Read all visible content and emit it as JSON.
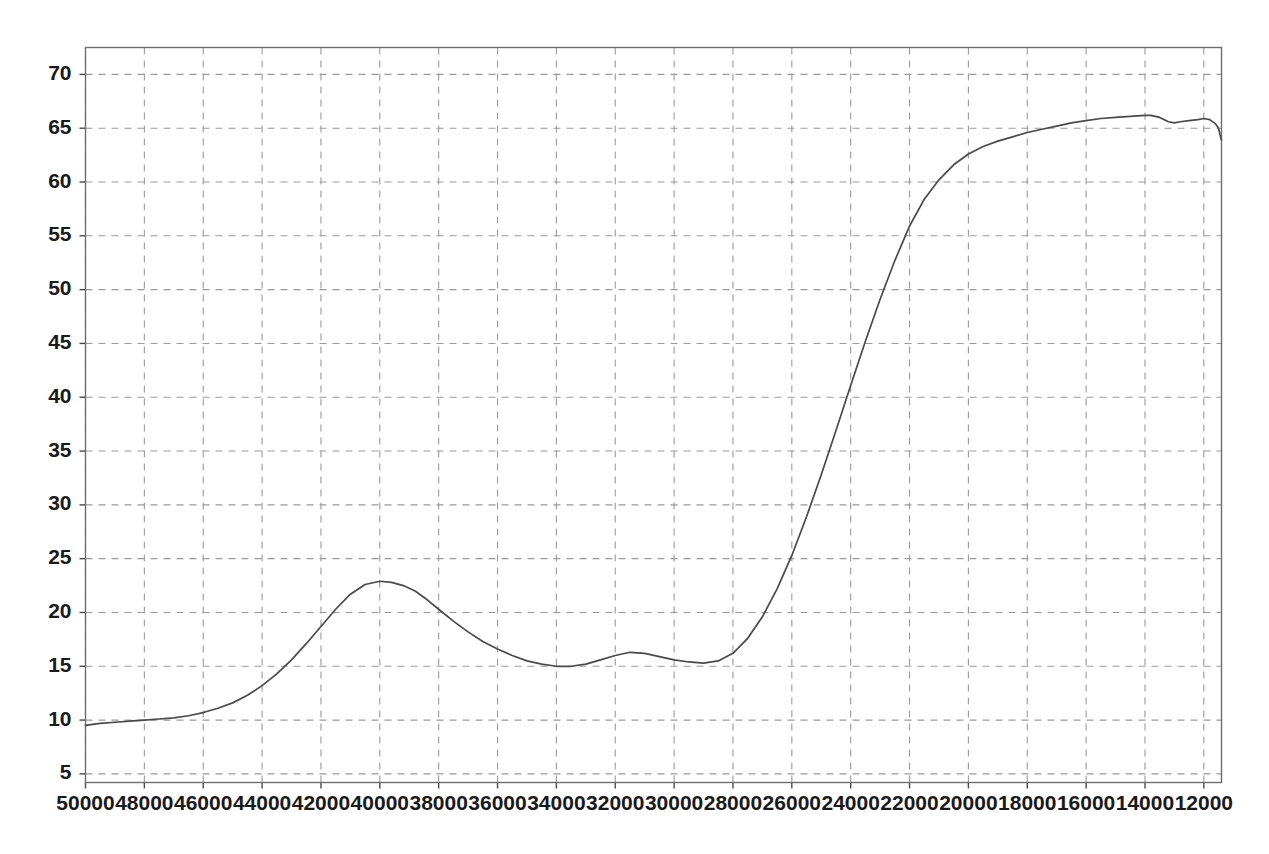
{
  "chart_data": {
    "type": "line",
    "title": "",
    "subtitle": "",
    "xlabel": "",
    "ylabel": "",
    "xlim": [
      50000,
      11400
    ],
    "ylim": [
      4.2,
      72.5
    ],
    "x_axis_reversed": true,
    "grid": true,
    "legend": "none",
    "line_color": "#4a4a4a",
    "grid_color": "#9a9a9a",
    "frame_color": "#6f6f6f",
    "background_color": "#ffffff",
    "xticks": [
      50000,
      48000,
      46000,
      44000,
      42000,
      40000,
      38000,
      36000,
      34000,
      32000,
      30000,
      28000,
      26000,
      24000,
      22000,
      20000,
      18000,
      16000,
      14000,
      12000
    ],
    "xtick_labels": [
      "50000",
      "48000",
      "46000",
      "44000",
      "42000",
      "40000",
      "38000",
      "36000",
      "34000",
      "32000",
      "30000",
      "28000",
      "26000",
      "24000",
      "22000",
      "20000",
      "18000",
      "16000",
      "14000",
      "12000"
    ],
    "yticks": [
      5,
      10,
      15,
      20,
      25,
      30,
      35,
      40,
      45,
      50,
      55,
      60,
      65,
      70
    ],
    "ytick_labels": [
      "5",
      "10",
      "15",
      "20",
      "25",
      "30",
      "35",
      "40",
      "45",
      "50",
      "55",
      "60",
      "65",
      "70"
    ],
    "series": [
      {
        "name": "spectrum",
        "x": [
          50000,
          49500,
          49000,
          48500,
          48000,
          47500,
          47000,
          46500,
          46000,
          45500,
          45000,
          44500,
          44000,
          43500,
          43000,
          42500,
          42000,
          41500,
          41000,
          40500,
          40000,
          39600,
          39200,
          38800,
          38400,
          38000,
          37500,
          37000,
          36500,
          36000,
          35500,
          35000,
          34500,
          34000,
          33500,
          33000,
          32500,
          32000,
          31500,
          31000,
          30500,
          30000,
          29500,
          29000,
          28500,
          28000,
          27500,
          27000,
          26500,
          26000,
          25500,
          25000,
          24500,
          24000,
          23500,
          23000,
          22500,
          22000,
          21500,
          21000,
          20500,
          20000,
          19500,
          19000,
          18500,
          18000,
          17500,
          17000,
          16500,
          16000,
          15500,
          15000,
          14500,
          14000,
          13800,
          13500,
          13200,
          13000,
          12800,
          12500,
          12200,
          12000,
          11800,
          11600,
          11500,
          11450,
          11400
        ],
        "y": [
          9.5,
          9.7,
          9.8,
          9.9,
          10.0,
          10.1,
          10.2,
          10.4,
          10.7,
          11.1,
          11.6,
          12.3,
          13.2,
          14.3,
          15.6,
          17.1,
          18.7,
          20.3,
          21.7,
          22.6,
          22.9,
          22.8,
          22.5,
          22.0,
          21.2,
          20.3,
          19.2,
          18.2,
          17.3,
          16.6,
          16.0,
          15.5,
          15.2,
          15.0,
          15.0,
          15.2,
          15.6,
          16.0,
          16.3,
          16.2,
          15.9,
          15.6,
          15.4,
          15.3,
          15.5,
          16.2,
          17.6,
          19.6,
          22.2,
          25.3,
          28.9,
          32.8,
          36.9,
          41.1,
          45.2,
          49.1,
          52.7,
          55.9,
          58.4,
          60.2,
          61.6,
          62.6,
          63.3,
          63.8,
          64.2,
          64.6,
          64.9,
          65.2,
          65.5,
          65.7,
          65.9,
          66.0,
          66.1,
          66.2,
          66.2,
          66.0,
          65.6,
          65.5,
          65.6,
          65.7,
          65.8,
          65.9,
          65.8,
          65.4,
          65.0,
          64.4,
          63.9
        ],
        "peak_x": 40000,
        "peak_y": 22.9,
        "valley_x": 34000,
        "valley_y": 15.0,
        "secondary_peak_x": 31500,
        "secondary_peak_y": 16.3,
        "second_valley_x": 29000,
        "second_valley_y": 15.3,
        "plateau_y": 66.2,
        "start_y": 9.5,
        "end_y": 63.9
      }
    ]
  }
}
